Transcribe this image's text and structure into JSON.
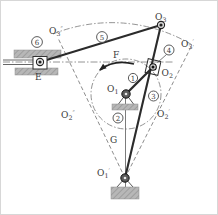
{
  "figure": {
    "type": "crank-shaper-linkage-kinematic-diagram",
    "points": [
      {
        "id": "O3",
        "base": "O",
        "sub": "3",
        "sup": ""
      },
      {
        "id": "O3p",
        "base": "O",
        "sub": "3",
        "sup": "′"
      },
      {
        "id": "O3pp",
        "base": "O",
        "sub": "3",
        "sup": "″"
      },
      {
        "id": "O2",
        "base": "O",
        "sub": "2",
        "sup": ""
      },
      {
        "id": "O2p",
        "base": "O",
        "sub": "2",
        "sup": "′"
      },
      {
        "id": "O2pp",
        "base": "O",
        "sub": "2",
        "sup": "″"
      },
      {
        "id": "O1",
        "base": "O",
        "sub": "1",
        "sup": ""
      },
      {
        "id": "O1p",
        "base": "O",
        "sub": "1",
        "sup": "′"
      },
      {
        "id": "E",
        "base": "E",
        "sub": "",
        "sup": ""
      },
      {
        "id": "F",
        "base": "F",
        "sub": "",
        "sup": ""
      },
      {
        "id": "G",
        "base": "G",
        "sub": "",
        "sup": ""
      }
    ],
    "links": [
      "1",
      "2",
      "3",
      "4",
      "5",
      "6"
    ]
  },
  "colors": {
    "line": "#2b2b2b",
    "thin": "#5a5a5a",
    "construction": "#787878",
    "metal": "#b7b7b7",
    "hatch": "#8a8a8a",
    "text": "#3a3a3a",
    "frame": "#d7d7d7"
  }
}
